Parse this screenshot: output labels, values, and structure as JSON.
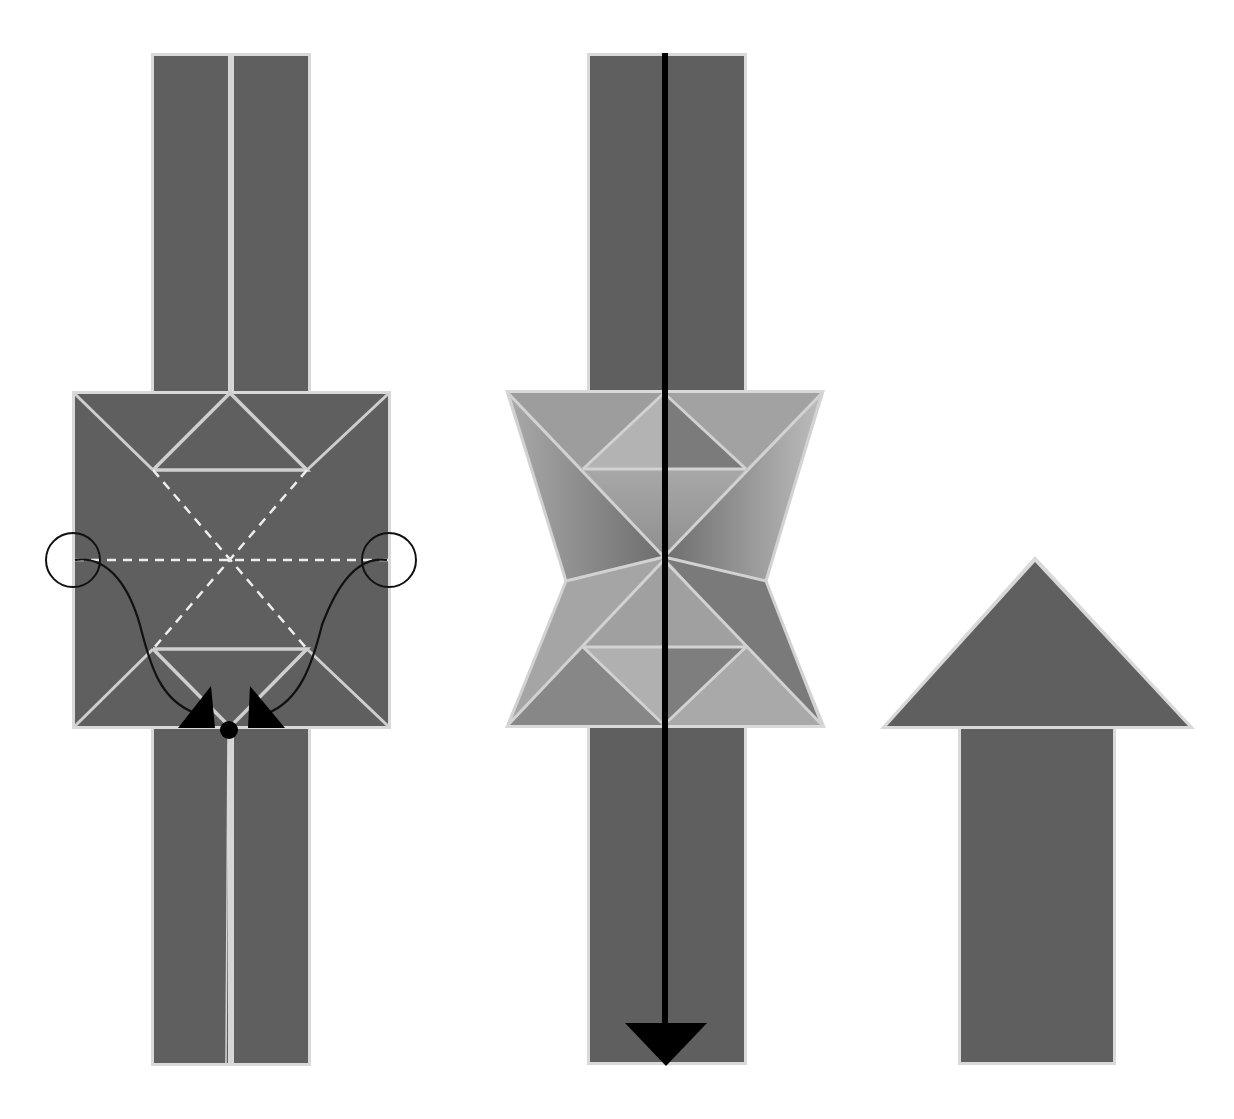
{
  "diagram": {
    "type": "origami-folding-steps",
    "colors": {
      "paper_dark": "#5f5f5f",
      "paper_mid": "#8a8a8a",
      "paper_light": "#b3b3b3",
      "crease": "#d6d6d6",
      "edge": "#d9d9d9",
      "arrow": "#000000",
      "background": "#ffffff"
    },
    "steps": [
      {
        "id": "step-1",
        "description": "Square base on a vertical strip with valley-fold dashed lines; edges circled at left and right middle are brought down to the bottom center point.",
        "symbols": [
          "left-circle",
          "right-circle",
          "curved-arrow-left",
          "curved-arrow-right",
          "target-dot",
          "dashed-valley-lines"
        ]
      },
      {
        "id": "step-2",
        "description": "Collapsed hourglass/bow-tie shape on the strip with a long vertical arrow pointing down (turn over / fold down).",
        "symbols": [
          "vertical-down-arrow"
        ]
      },
      {
        "id": "step-3",
        "description": "Finished arrow shape pointing up.",
        "symbols": []
      }
    ]
  }
}
